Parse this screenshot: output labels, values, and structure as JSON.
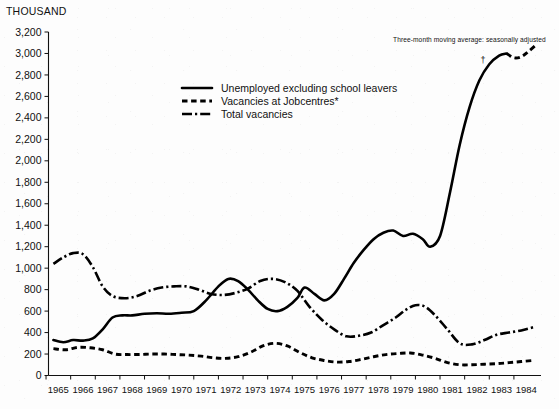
{
  "unit_label": "THOUSAND",
  "annotation": {
    "text": "Three-month moving average: seasonally adjusted",
    "dagger": "†"
  },
  "legend": {
    "items": [
      {
        "label": "Unemployed excluding school leavers",
        "style": "solid"
      },
      {
        "label": "Vacancies at Jobcentres*",
        "style": "dotted"
      },
      {
        "label": "Total vacancies",
        "style": "dash-dot"
      }
    ]
  },
  "chart_data": {
    "type": "line",
    "title": "",
    "subtitle": "",
    "xlabel": "",
    "ylabel": "THOUSAND",
    "xlim": [
      1964.6,
      1984.6
    ],
    "ylim": [
      0,
      3200
    ],
    "grid": false,
    "legend_position": "upper-left-inside",
    "yticks": [
      0,
      200,
      400,
      600,
      800,
      1000,
      1200,
      1400,
      1600,
      1800,
      2000,
      2200,
      2400,
      2600,
      2800,
      3000,
      3200
    ],
    "ytick_labels": [
      "0",
      "200",
      "400",
      "600",
      "800",
      "1,000",
      "1,200",
      "1,400",
      "1,600",
      "1,800",
      "2,000",
      "2,200",
      "2,400",
      "2,600",
      "2,800",
      "3,000",
      "3,200"
    ],
    "xticks": [
      1965,
      1966,
      1967,
      1968,
      1969,
      1970,
      1971,
      1972,
      1973,
      1974,
      1975,
      1976,
      1977,
      1978,
      1979,
      1980,
      1981,
      1982,
      1983,
      1984
    ],
    "xtick_labels": [
      "1965",
      "1966",
      "1967",
      "1968",
      "1969",
      "1970",
      "1971",
      "1972",
      "1973",
      "1974",
      "1975",
      "1976",
      "1977",
      "1978",
      "1979",
      "1980",
      "1981",
      "1982",
      "1983",
      "1984"
    ],
    "series": [
      {
        "name": "Unemployed excluding school leavers",
        "style": "solid",
        "x": [
          1964.8,
          1965.2,
          1965.6,
          1966.0,
          1966.4,
          1966.8,
          1967.2,
          1967.6,
          1968.0,
          1968.5,
          1969.0,
          1969.5,
          1970.0,
          1970.5,
          1971.0,
          1971.5,
          1971.9,
          1972.3,
          1972.7,
          1973.1,
          1973.5,
          1973.9,
          1974.3,
          1974.7,
          1975.0,
          1975.4,
          1975.8,
          1976.2,
          1976.6,
          1977.0,
          1977.4,
          1977.8,
          1978.2,
          1978.6,
          1979.0,
          1979.4,
          1979.8,
          1980.1,
          1980.5,
          1980.9,
          1981.3,
          1981.7,
          1982.1,
          1982.5,
          1982.9,
          1983.2
        ],
        "y": [
          330,
          310,
          330,
          325,
          345,
          430,
          540,
          560,
          560,
          575,
          580,
          575,
          585,
          600,
          700,
          830,
          900,
          880,
          800,
          700,
          620,
          600,
          640,
          720,
          820,
          760,
          700,
          760,
          900,
          1050,
          1170,
          1270,
          1330,
          1350,
          1300,
          1320,
          1270,
          1200,
          1300,
          1700,
          2150,
          2500,
          2750,
          2900,
          2980,
          3000
        ]
      },
      {
        "name": "Unemployed excluding school leavers (provisional)",
        "style": "dotted-tail",
        "x": [
          1983.2,
          1983.5,
          1983.8,
          1984.1,
          1984.4
        ],
        "y": [
          3000,
          2960,
          2970,
          3020,
          3080
        ]
      },
      {
        "name": "Vacancies at Jobcentres*",
        "style": "dotted",
        "x": [
          1964.8,
          1965.3,
          1965.8,
          1966.3,
          1966.8,
          1967.3,
          1967.8,
          1968.3,
          1968.8,
          1969.3,
          1969.8,
          1970.3,
          1970.8,
          1971.3,
          1971.8,
          1972.3,
          1972.8,
          1973.3,
          1973.8,
          1974.3,
          1974.8,
          1975.3,
          1975.8,
          1976.3,
          1976.8,
          1977.3,
          1977.8,
          1978.3,
          1978.8,
          1979.3,
          1979.8,
          1980.3,
          1980.8,
          1981.3,
          1981.8,
          1982.3,
          1982.8,
          1983.3,
          1983.8,
          1984.3
        ],
        "y": [
          250,
          240,
          262,
          258,
          240,
          200,
          195,
          196,
          200,
          200,
          195,
          190,
          180,
          165,
          160,
          175,
          215,
          275,
          300,
          275,
          215,
          165,
          140,
          125,
          130,
          150,
          175,
          195,
          205,
          210,
          190,
          160,
          120,
          100,
          100,
          105,
          110,
          120,
          130,
          140
        ]
      },
      {
        "name": "Total vacancies",
        "style": "dash-dot",
        "x": [
          1964.8,
          1965.2,
          1965.6,
          1966.0,
          1966.4,
          1966.8,
          1967.2,
          1967.7,
          1968.2,
          1968.7,
          1969.2,
          1969.7,
          1970.2,
          1970.7,
          1971.2,
          1971.7,
          1972.2,
          1972.7,
          1973.2,
          1973.7,
          1974.2,
          1974.7,
          1975.2,
          1975.7,
          1976.2,
          1976.7,
          1977.2,
          1977.7,
          1978.2,
          1978.7,
          1979.1,
          1979.5,
          1979.9,
          1980.3,
          1980.8,
          1981.3,
          1981.8,
          1982.3,
          1982.8,
          1983.3,
          1983.8,
          1984.3
        ],
        "y": [
          1040,
          1100,
          1140,
          1130,
          1010,
          830,
          740,
          720,
          740,
          790,
          820,
          830,
          830,
          800,
          760,
          750,
          770,
          810,
          880,
          900,
          870,
          790,
          640,
          520,
          430,
          365,
          370,
          400,
          470,
          540,
          610,
          655,
          640,
          560,
          430,
          300,
          290,
          330,
          380,
          400,
          420,
          450
        ]
      }
    ]
  }
}
